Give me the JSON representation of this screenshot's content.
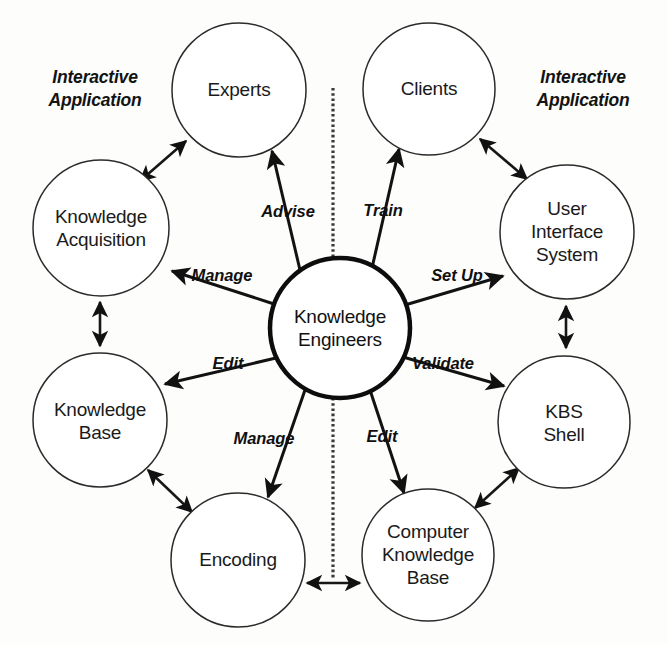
{
  "diagram": {
    "background_color": "#fdfdfc",
    "line_color": "#121212",
    "text_color": "#1a1a1a",
    "center": {
      "id": "knowledge-engineers",
      "label_line1": "Knowledge",
      "label_line2": "Engineers",
      "cx": 340,
      "cy": 328,
      "r": 70
    },
    "nodes": [
      {
        "id": "experts",
        "lines": [
          "Experts"
        ],
        "cx": 239,
        "cy": 90,
        "r": 67
      },
      {
        "id": "clients",
        "lines": [
          "Clients"
        ],
        "cx": 429,
        "cy": 89,
        "r": 66
      },
      {
        "id": "knowledge-acquisition",
        "lines": [
          "Knowledge",
          "Acquisition"
        ],
        "cx": 101,
        "cy": 228,
        "r": 68
      },
      {
        "id": "user-interface-system",
        "lines": [
          "User",
          "Interface",
          "System"
        ],
        "cx": 567,
        "cy": 232,
        "r": 67
      },
      {
        "id": "knowledge-base",
        "lines": [
          "Knowledge",
          "Base"
        ],
        "cx": 100,
        "cy": 420,
        "r": 67
      },
      {
        "id": "kbs-shell",
        "lines": [
          "KBS",
          "Shell"
        ],
        "cx": 564,
        "cy": 422,
        "r": 66
      },
      {
        "id": "encoding",
        "lines": [
          "Encoding"
        ],
        "cx": 238,
        "cy": 560,
        "r": 67
      },
      {
        "id": "computer-knowledge-base",
        "lines": [
          "Computer",
          "Knowledge",
          "Base"
        ],
        "cx": 428,
        "cy": 555,
        "r": 66
      }
    ],
    "relations": [
      {
        "id": "advise",
        "label": "Advise",
        "from": "knowledge-engineers",
        "to": "experts",
        "label_x": 288,
        "label_y": 213,
        "direction": "one-way"
      },
      {
        "id": "train",
        "label": "Train",
        "from": "knowledge-engineers",
        "to": "clients",
        "label_x": 383,
        "label_y": 212,
        "direction": "one-way"
      },
      {
        "id": "manage-ka",
        "label": "Manage",
        "from": "knowledge-engineers",
        "to": "knowledge-acquisition",
        "label_x": 222,
        "label_y": 277,
        "direction": "one-way"
      },
      {
        "id": "set-up",
        "label": "Set Up",
        "from": "knowledge-engineers",
        "to": "user-interface-system",
        "label_x": 457,
        "label_y": 277,
        "direction": "one-way"
      },
      {
        "id": "edit-kb",
        "label": "Edit",
        "from": "knowledge-engineers",
        "to": "knowledge-base",
        "label_x": 228,
        "label_y": 365,
        "direction": "one-way"
      },
      {
        "id": "validate",
        "label": "Validate",
        "from": "knowledge-engineers",
        "to": "kbs-shell",
        "label_x": 443,
        "label_y": 365,
        "direction": "one-way"
      },
      {
        "id": "manage-encoding",
        "label": "Manage",
        "from": "knowledge-engineers",
        "to": "encoding",
        "label_x": 264,
        "label_y": 440,
        "direction": "one-way"
      },
      {
        "id": "edit-ckb",
        "label": "Edit",
        "from": "knowledge-engineers",
        "to": "computer-knowledge-base",
        "label_x": 382,
        "label_y": 438,
        "direction": "one-way"
      }
    ],
    "bidirectional_links": [
      {
        "id": "ka-experts",
        "from": "knowledge-acquisition",
        "to": "experts"
      },
      {
        "id": "clients-uis",
        "from": "clients",
        "to": "user-interface-system"
      },
      {
        "id": "ka-kb",
        "from": "knowledge-acquisition",
        "to": "knowledge-base"
      },
      {
        "id": "uis-kbs",
        "from": "user-interface-system",
        "to": "kbs-shell"
      },
      {
        "id": "kb-encoding",
        "from": "knowledge-base",
        "to": "encoding"
      },
      {
        "id": "ckb-kbs",
        "from": "computer-knowledge-base",
        "to": "kbs-shell"
      },
      {
        "id": "encoding-ckb",
        "from": "encoding",
        "to": "computer-knowledge-base"
      }
    ],
    "side_labels": [
      {
        "id": "interactive-application-left",
        "line1": "Interactive",
        "line2": "Application",
        "x": 95,
        "y": 90
      },
      {
        "id": "interactive-application-right",
        "line1": "Interactive",
        "line2": "Application",
        "x": 583,
        "y": 90
      }
    ],
    "divider": {
      "id": "vertical-divider",
      "x": 333,
      "y_top": 88,
      "y_bottom": 578,
      "style": "hatched-dashed"
    }
  }
}
